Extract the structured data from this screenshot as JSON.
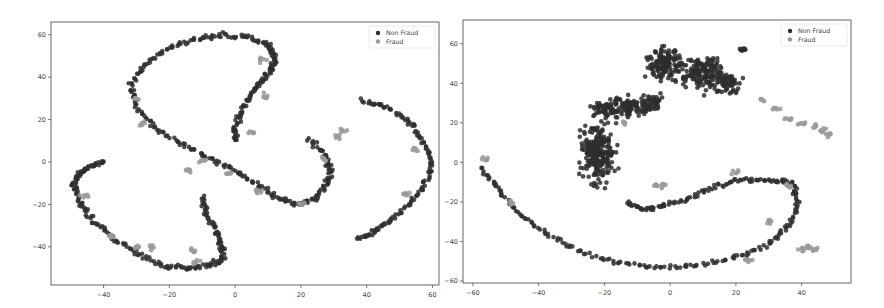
{
  "figure": {
    "background": "#ffffff",
    "colors": {
      "non_fraud": "#2e2e2e",
      "fraud": "#9a9a9a",
      "axis": "#555555"
    }
  },
  "chart_data": [
    {
      "type": "scatter",
      "title": "",
      "xlabel": "",
      "ylabel": "",
      "frame_px": {
        "left": 51,
        "top": 22,
        "right": 439,
        "bottom": 285
      },
      "xlim": [
        -56,
        62
      ],
      "ylim": [
        -58,
        66
      ],
      "xticks": [
        -40,
        -20,
        0,
        20,
        40,
        60
      ],
      "yticks": [
        -40,
        -20,
        0,
        20,
        40,
        60
      ],
      "grid": false,
      "legend": {
        "position": "upper right",
        "entries": [
          "Non Fraud",
          "Fraud"
        ]
      },
      "series": [
        {
          "name": "Non Fraud",
          "color": "#2e2e2e",
          "curves": [
            [
              [
                -40,
                0
              ],
              [
                -44,
                -2
              ],
              [
                -48,
                -6
              ],
              [
                -49,
                -12
              ],
              [
                -47,
                -20
              ],
              [
                -43,
                -28
              ],
              [
                -37,
                -36
              ],
              [
                -30,
                -43
              ],
              [
                -22,
                -49
              ],
              [
                -15,
                -50
              ],
              [
                -8,
                -49
              ],
              [
                -4,
                -46
              ],
              [
                -4,
                -40
              ],
              [
                -6,
                -32
              ],
              [
                -9,
                -24
              ],
              [
                -10,
                -16
              ]
            ],
            [
              [
                0,
                10
              ],
              [
                0,
                16
              ],
              [
                2,
                24
              ],
              [
                5,
                32
              ],
              [
                8,
                38
              ],
              [
                11,
                44
              ],
              [
                12,
                50
              ],
              [
                10,
                55
              ],
              [
                4,
                59
              ],
              [
                -4,
                60
              ],
              [
                -12,
                58
              ],
              [
                -20,
                54
              ],
              [
                -27,
                46
              ],
              [
                -32,
                36
              ],
              [
                -30,
                26
              ],
              [
                -24,
                16
              ],
              [
                -16,
                8
              ],
              [
                -8,
                2
              ],
              [
                0,
                -4
              ],
              [
                6,
                -10
              ],
              [
                12,
                -16
              ],
              [
                18,
                -20
              ],
              [
                24,
                -18
              ],
              [
                28,
                -10
              ],
              [
                29,
                -4
              ],
              [
                27,
                4
              ],
              [
                22,
                11
              ]
            ],
            [
              [
                38,
                29
              ],
              [
                46,
                26
              ],
              [
                53,
                19
              ],
              [
                57,
                10
              ],
              [
                60,
                0
              ],
              [
                58,
                -10
              ],
              [
                53,
                -20
              ],
              [
                47,
                -28
              ],
              [
                42,
                -33
              ],
              [
                37,
                -37
              ]
            ]
          ]
        },
        {
          "name": "Fraud",
          "color": "#9a9a9a",
          "clusters": [
            [
              -38,
              -35
            ],
            [
              -30,
              -40
            ],
            [
              -13,
              -42
            ],
            [
              -12,
              -47
            ],
            [
              -30,
              30
            ],
            [
              -28,
              18
            ],
            [
              -10,
              0
            ],
            [
              5,
              14
            ],
            [
              9,
              31
            ],
            [
              8,
              48
            ],
            [
              33,
              15
            ],
            [
              31,
              12
            ],
            [
              -14,
              -4
            ],
            [
              -2,
              -5
            ],
            [
              7,
              -14
            ],
            [
              20,
              -20
            ],
            [
              27,
              2
            ],
            [
              52,
              -15
            ],
            [
              55,
              6
            ],
            [
              -46,
              -16
            ],
            [
              -26,
              -40
            ]
          ]
        }
      ]
    },
    {
      "type": "scatter",
      "title": "",
      "xlabel": "",
      "ylabel": "",
      "frame_px": {
        "left": 463,
        "top": 20,
        "right": 851,
        "bottom": 283
      },
      "xlim": [
        -63,
        55
      ],
      "ylim": [
        -61,
        72
      ],
      "xticks": [
        -60,
        -40,
        -20,
        0,
        20,
        40
      ],
      "yticks": [
        -60,
        -40,
        -20,
        0,
        20,
        40,
        60
      ],
      "grid": false,
      "legend": {
        "position": "upper right",
        "entries": [
          "Non Fraud",
          "Fraud"
        ]
      },
      "series": [
        {
          "name": "Non Fraud",
          "color": "#2e2e2e",
          "curves": [
            [
              [
                -57,
                -3
              ],
              [
                -52,
                -14
              ],
              [
                -46,
                -26
              ],
              [
                -38,
                -36
              ],
              [
                -28,
                -45
              ],
              [
                -16,
                -51
              ],
              [
                -4,
                -53
              ],
              [
                8,
                -52
              ],
              [
                20,
                -48
              ],
              [
                30,
                -42
              ],
              [
                36,
                -32
              ],
              [
                39,
                -20
              ],
              [
                37,
                -10
              ],
              [
                30,
                -9
              ],
              [
                22,
                -9
              ],
              [
                14,
                -12
              ],
              [
                6,
                -18
              ],
              [
                -2,
                -22
              ],
              [
                -8,
                -24
              ],
              [
                -14,
                -20
              ]
            ]
          ],
          "blobs": [
            {
              "cx": -22,
              "cy": 5,
              "rx": 8,
              "ry": 22
            },
            {
              "cx": -12,
              "cy": 28,
              "rx": 8,
              "ry": 8
            },
            {
              "cx": -2,
              "cy": 50,
              "rx": 8,
              "ry": 12
            },
            {
              "cx": 10,
              "cy": 45,
              "rx": 10,
              "ry": 12
            },
            {
              "cx": 18,
              "cy": 40,
              "rx": 5,
              "ry": 7
            },
            {
              "cx": 22,
              "cy": 57,
              "rx": 2,
              "ry": 1
            },
            {
              "cx": -5,
              "cy": 30,
              "rx": 5,
              "ry": 6
            },
            {
              "cx": -20,
              "cy": 28,
              "rx": 6,
              "ry": 6
            }
          ]
        },
        {
          "name": "Fraud",
          "color": "#9a9a9a",
          "clusters": [
            [
              -56,
              2
            ],
            [
              -48,
              -20
            ],
            [
              28,
              32
            ],
            [
              32,
              27
            ],
            [
              36,
              22
            ],
            [
              40,
              20
            ],
            [
              44,
              18
            ],
            [
              46,
              16
            ],
            [
              48,
              14
            ],
            [
              40,
              -44
            ],
            [
              42,
              -43
            ],
            [
              44,
              -44
            ],
            [
              -4,
              -12
            ],
            [
              -2,
              -12
            ],
            [
              -14,
              20
            ],
            [
              20,
              -5
            ],
            [
              24,
              -50
            ],
            [
              30,
              -30
            ],
            [
              36,
              -12
            ]
          ]
        }
      ]
    }
  ]
}
